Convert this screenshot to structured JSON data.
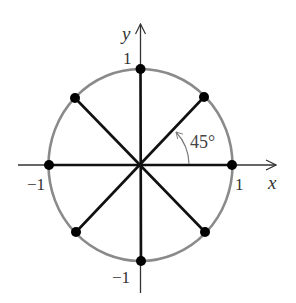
{
  "diagram": {
    "center": {
      "x": 140.5,
      "y": 165
    },
    "radius": {
      "rx": 92,
      "ry": 96
    },
    "colors": {
      "circle": "#8a8a8a",
      "spokes": "#111111",
      "axes": "#333333",
      "points": "#000000",
      "angle_arc": "#777777",
      "text": "#333333"
    },
    "axes": {
      "x": {
        "label": "x",
        "from": 18,
        "to": 276
      },
      "y": {
        "label": "y",
        "from": 293,
        "to": 24
      }
    },
    "tick_labels": {
      "x_pos": "1",
      "x_neg": "−1",
      "y_pos": "1",
      "y_neg": "−1"
    },
    "angle": {
      "label": "45°",
      "degrees": 45
    },
    "points": [
      {
        "name": "point-0deg",
        "angle_deg": 0,
        "x": 232,
        "y": 165
      },
      {
        "name": "point-45deg",
        "angle_deg": 45,
        "x": 204,
        "y": 97
      },
      {
        "name": "point-90deg",
        "angle_deg": 90,
        "x": 140,
        "y": 69
      },
      {
        "name": "point-135deg",
        "angle_deg": 135,
        "x": 75,
        "y": 98
      },
      {
        "name": "point-180deg",
        "angle_deg": 180,
        "x": 49,
        "y": 165
      },
      {
        "name": "point-225deg",
        "angle_deg": 225,
        "x": 76,
        "y": 232
      },
      {
        "name": "point-270deg",
        "angle_deg": 270,
        "x": 141,
        "y": 261
      },
      {
        "name": "point-315deg",
        "angle_deg": 315,
        "x": 205,
        "y": 232
      }
    ]
  }
}
